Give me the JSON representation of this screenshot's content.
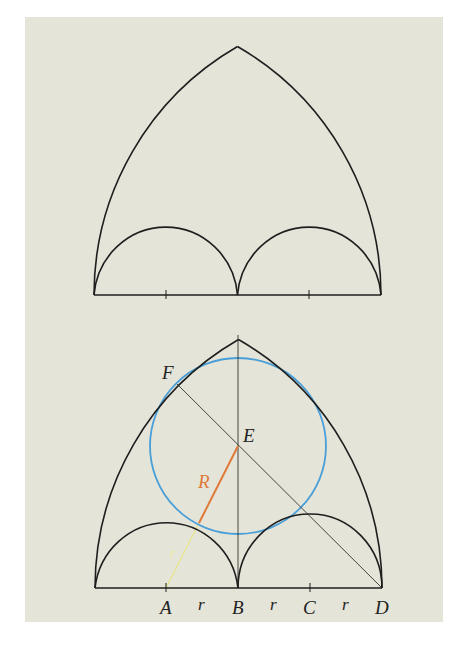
{
  "figure": {
    "background": "#e5e4d8",
    "stroke_color": "#1e1e1e",
    "circle_color": "#4a9fd8",
    "radius_R_color": "#e07a3a",
    "radius_r_color": "#e6e48a",
    "top_diagram": {
      "description": "Equilateral pointed arch with two inner semicircular sub-arches",
      "base": {
        "x1": 94,
        "x2": 381,
        "y": 295
      },
      "apex": {
        "x": 237,
        "y": 41
      },
      "ticks_x": [
        166,
        309
      ]
    },
    "bottom_diagram": {
      "description": "Construction of inscribed circle tangent to outer arch and sub-arches",
      "point_labels": {
        "A": "A",
        "B": "B",
        "C": "C",
        "D": "D",
        "E": "E",
        "F": "F"
      },
      "segment_labels": {
        "r1": "r",
        "r2": "r",
        "r3": "r",
        "R": "R",
        "r_small": "r"
      },
      "points": {
        "A": {
          "x": 166,
          "y": 588
        },
        "B": {
          "x": 238,
          "y": 588
        },
        "C": {
          "x": 310,
          "y": 588
        },
        "D": {
          "x": 382,
          "y": 588
        },
        "E": {
          "x": 238,
          "y": 446
        },
        "F": {
          "x": 177,
          "y": 384
        }
      },
      "inscribed_circle": {
        "cx": 238,
        "cy": 446,
        "r": 88
      }
    }
  }
}
